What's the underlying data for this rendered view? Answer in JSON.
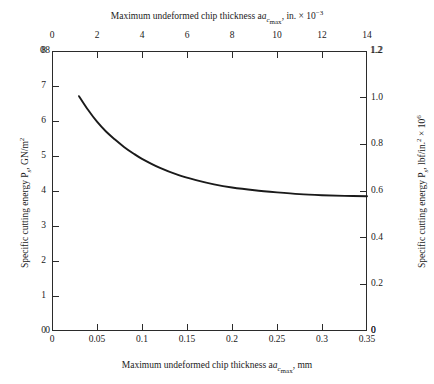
{
  "chart_data": {
    "type": "line",
    "title": "",
    "top_axis": {
      "label": "Maximum undeformed chip thickness a_cmax, in. × 10⁻³",
      "ticks": [
        0,
        2,
        4,
        6,
        8,
        10,
        12,
        14
      ],
      "range": [
        0,
        14
      ],
      "units": "in. × 10⁻³"
    },
    "bottom_axis": {
      "label": "Maximum undeformed chip thickness a_cmax, mm",
      "ticks": [
        0,
        0.05,
        0.1,
        0.15,
        0.2,
        0.25,
        0.3,
        0.35
      ],
      "tick_labels": [
        "0",
        "0.05",
        "0.1",
        "0.15",
        "0.2",
        "0.25",
        "0.3",
        "0.35"
      ],
      "range": [
        0,
        0.35
      ],
      "units": "mm"
    },
    "left_axis": {
      "label": "Specific cutting energy P_s, GN/m²",
      "ticks": [
        0,
        1,
        2,
        3,
        4,
        5,
        6,
        7,
        8
      ],
      "range": [
        0,
        8
      ],
      "units": "GN/m²"
    },
    "right_axis": {
      "label": "Specific cutting energy P_s, lbf/in.² × 10⁶",
      "ticks": [
        0,
        0.2,
        0.4,
        0.6,
        0.8,
        1.0,
        1.2
      ],
      "tick_labels": [
        "0",
        "0.2",
        "0.4",
        "0.6",
        "0.8",
        "1.0",
        "1.2"
      ],
      "range": [
        0,
        1.2
      ],
      "units": "lbf/in.² × 10⁶"
    },
    "grid": false,
    "legend": null,
    "series": [
      {
        "name": "Specific cutting energy",
        "x": [
          0.03,
          0.04,
          0.05,
          0.06,
          0.07,
          0.08,
          0.09,
          0.1,
          0.12,
          0.14,
          0.16,
          0.18,
          0.2,
          0.225,
          0.25,
          0.275,
          0.3,
          0.325,
          0.35
        ],
        "y": [
          6.71,
          6.32,
          5.98,
          5.7,
          5.47,
          5.26,
          5.08,
          4.92,
          4.66,
          4.46,
          4.31,
          4.19,
          4.1,
          4.02,
          3.96,
          3.91,
          3.88,
          3.86,
          3.85
        ]
      }
    ]
  },
  "labels": {
    "top_title": "Maximum undeformed chip thickness a",
    "top_title_sub": "c",
    "top_title_sub2": "max",
    "top_title_tail": ", in. × 10",
    "top_title_sup": "−3",
    "bottom_title": "Maximum undeformed chip thickness a",
    "bottom_title_sub": "c",
    "bottom_title_sub2": "max",
    "bottom_title_tail": ", mm",
    "left_title": "Specific cutting energy P",
    "left_title_sub": "s",
    "left_title_tail": ", GN/m",
    "left_title_sup": "2",
    "right_title": "Specific cutting energy P",
    "right_title_sub": "s",
    "right_title_tail": ", lbf/in.",
    "right_title_sup": "2",
    "right_title_tail2": " × 10",
    "right_title_sup2": "6"
  },
  "corners": {
    "top_left": "0",
    "top_left_y": "8",
    "top_right": "14",
    "top_right_y": "1.2",
    "bottom_left": "0",
    "bottom_left_y": "0",
    "bottom_right": "0.35",
    "bottom_right_y": "0"
  },
  "colors": {
    "axis": "#2b2b2b",
    "curve": "#1a1a1a",
    "background": "#ffffff"
  }
}
